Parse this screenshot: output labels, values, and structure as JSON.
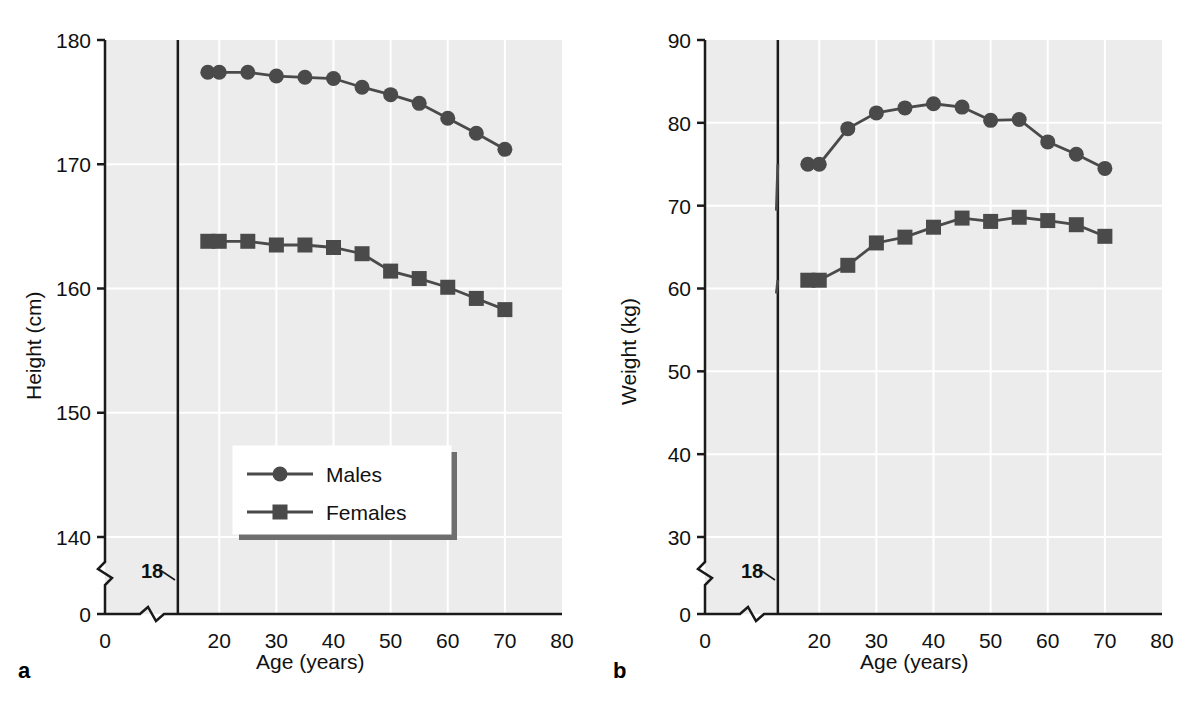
{
  "figure": {
    "background": "#ffffff",
    "plot_background": "#ececec",
    "grid_color": "#ffffff",
    "series_color": "#4a4a4a",
    "axis_color": "#1a1a1a"
  },
  "panels": [
    {
      "letter": "a",
      "chart_data": {
        "type": "line",
        "title": "",
        "xlabel": "Age (years)",
        "ylabel": "Height (cm)",
        "xlim": [
          0,
          80
        ],
        "ylim": [
          140,
          180
        ],
        "yaxis_break": true,
        "yaxis_break_zero_label": "0",
        "xaxis_break": true,
        "xticks": [
          0,
          20,
          30,
          40,
          50,
          60,
          70,
          80
        ],
        "xtick_labels": [
          "0",
          "20",
          "30",
          "40",
          "50",
          "60",
          "70",
          "80"
        ],
        "yticks": [
          140,
          150,
          160,
          170,
          180
        ],
        "ytick_labels": [
          "140",
          "150",
          "160",
          "170",
          "180"
        ],
        "grid": true,
        "reference_line": {
          "x": 18,
          "label": "18"
        },
        "legend_position": "bottom-center",
        "x": [
          18,
          20,
          25,
          30,
          35,
          40,
          45,
          50,
          55,
          60,
          65,
          70
        ],
        "series": [
          {
            "name": "Males",
            "marker": "circle",
            "values": [
              177.4,
              177.4,
              177.4,
              177.1,
              177.0,
              176.9,
              176.2,
              175.6,
              174.9,
              173.7,
              172.5,
              171.2
            ]
          },
          {
            "name": "Females",
            "marker": "square",
            "values": [
              163.8,
              163.8,
              163.8,
              163.5,
              163.5,
              163.3,
              162.8,
              161.4,
              160.8,
              160.1,
              159.2,
              158.3
            ]
          }
        ]
      }
    },
    {
      "letter": "b",
      "chart_data": {
        "type": "line",
        "title": "",
        "xlabel": "Age (years)",
        "ylabel": "Weight (kg)",
        "xlim": [
          0,
          80
        ],
        "ylim": [
          30,
          90
        ],
        "yaxis_break": true,
        "yaxis_break_zero_label": "0",
        "xaxis_break": true,
        "xticks": [
          0,
          20,
          30,
          40,
          50,
          60,
          70,
          80
        ],
        "xtick_labels": [
          "0",
          "20",
          "30",
          "40",
          "50",
          "60",
          "70",
          "80"
        ],
        "yticks": [
          30,
          40,
          50,
          60,
          70,
          80,
          90
        ],
        "ytick_labels": [
          "30",
          "40",
          "50",
          "60",
          "70",
          "80",
          "90"
        ],
        "grid": true,
        "reference_line": {
          "x": 18,
          "label": "18"
        },
        "legend_position": "none",
        "x": [
          18,
          20,
          25,
          30,
          35,
          40,
          45,
          50,
          55,
          60,
          65,
          70
        ],
        "series": [
          {
            "name": "Males",
            "marker": "circle",
            "values": [
              75.0,
              75.0,
              79.3,
              81.2,
              81.8,
              82.3,
              81.9,
              80.3,
              80.4,
              77.7,
              76.2,
              74.5
            ]
          },
          {
            "name": "Females",
            "marker": "square",
            "values": [
              61.0,
              61.0,
              62.8,
              65.5,
              66.2,
              67.4,
              68.5,
              68.1,
              68.6,
              68.2,
              67.7,
              66.3
            ]
          }
        ]
      }
    }
  ],
  "legend": {
    "items": [
      {
        "label": "Males",
        "marker": "circle"
      },
      {
        "label": "Females",
        "marker": "square"
      }
    ]
  }
}
